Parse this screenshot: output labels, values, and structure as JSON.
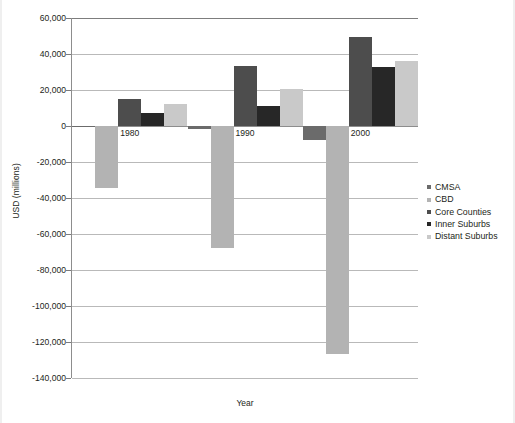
{
  "chart_data": {
    "type": "bar",
    "title": "",
    "subtitle": "",
    "xlabel": "Year",
    "ylabel": "USD (millions)",
    "categories": [
      "1980",
      "1990",
      "2000"
    ],
    "ylim": [
      -140000,
      60000
    ],
    "ytick_step": 20000,
    "ytick_labels": [
      "60,000",
      "40,000",
      "20,000",
      "0",
      "-20,000",
      "-40,000",
      "-60,000",
      "-80,000",
      "-100,000",
      "-120,000",
      "-140,000"
    ],
    "ytick_values": [
      60000,
      40000,
      20000,
      0,
      -20000,
      -40000,
      -60000,
      -80000,
      -100000,
      -120000,
      -140000
    ],
    "grid": true,
    "legend_position": "right",
    "series": [
      {
        "name": "CMSA",
        "color": "#6b6b6b",
        "values": [
          -600,
          -1600,
          -7600
        ]
      },
      {
        "name": "CBD",
        "color": "#b3b3b3",
        "values": [
          -34500,
          -67500,
          -126500
        ]
      },
      {
        "name": "Core Counties",
        "color": "#4d4d4d",
        "values": [
          15000,
          33500,
          49500
        ]
      },
      {
        "name": "Inner Suburbs",
        "color": "#272727",
        "values": [
          7000,
          11000,
          33000
        ]
      },
      {
        "name": "Distant Suburbs",
        "color": "#c9c9c9",
        "values": [
          12000,
          20500,
          36000
        ]
      }
    ]
  },
  "legend": {
    "items": [
      {
        "label": "CMSA",
        "color": "#6b6b6b"
      },
      {
        "label": "CBD",
        "color": "#b3b3b3"
      },
      {
        "label": "Core Counties",
        "color": "#4d4d4d"
      },
      {
        "label": "Inner Suburbs",
        "color": "#272727"
      },
      {
        "label": "Distant Suburbs",
        "color": "#c9c9c9"
      }
    ]
  },
  "axes": {
    "y_title": "USD (millions)",
    "x_title": "Year"
  }
}
